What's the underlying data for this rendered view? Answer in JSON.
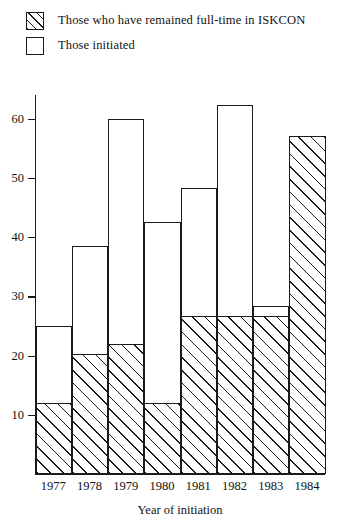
{
  "legend": {
    "items": [
      {
        "swatch": "hatched-square-icon",
        "label": "Those who have remained full-time in ISKCON"
      },
      {
        "swatch": "empty-square-icon",
        "label": "Those initiated"
      }
    ]
  },
  "axes": {
    "y_ticks": [
      "10",
      "20",
      "30",
      "40",
      "50",
      "60"
    ],
    "x_title": "Year of initiation"
  },
  "chart_data": {
    "type": "bar",
    "title": "",
    "subtitle": "",
    "xlabel": "Year of initiation",
    "ylabel": "",
    "categories": [
      "1977",
      "1978",
      "1979",
      "1980",
      "1981",
      "1982",
      "1983",
      "1984"
    ],
    "series": [
      {
        "name": "Those initiated",
        "values": [
          25,
          38.5,
          60,
          42.5,
          48.3,
          62.3,
          28.3,
          57
        ]
      },
      {
        "name": "Those who have remained full-time in ISKCON",
        "values": [
          12,
          20.3,
          22,
          12,
          26.7,
          26.7,
          26.7,
          57
        ]
      }
    ],
    "overlay": true,
    "ylim": [
      0,
      64
    ],
    "yticks": [
      10,
      20,
      30,
      40,
      50,
      60
    ],
    "grid": false,
    "legend_position": "top-left",
    "bar_style": {
      "initiated_fill": "#ffffff",
      "remained_fill": "diagonal-hatch",
      "outline": "#1a1a1a"
    }
  }
}
